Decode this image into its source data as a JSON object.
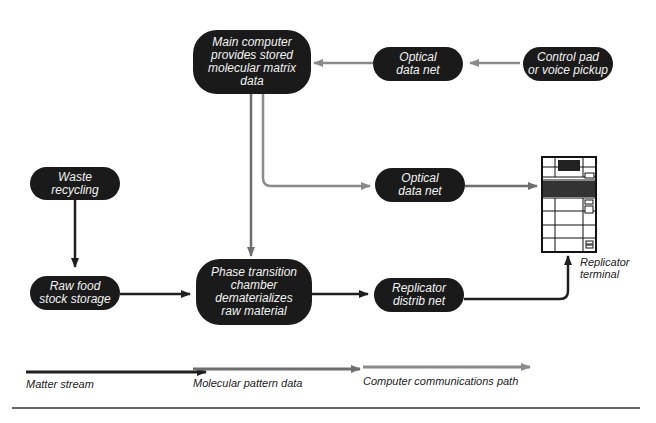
{
  "nodes": {
    "main_computer": {
      "lines": [
        "Main computer",
        "provides stored",
        "molecular matrix",
        "data"
      ]
    },
    "optical_top": {
      "lines": [
        "Optical",
        "data net"
      ]
    },
    "control_pad": {
      "lines": [
        "Control pad",
        "or voice pickup"
      ]
    },
    "waste": {
      "lines": [
        "Waste",
        "recycling"
      ]
    },
    "optical_mid": {
      "lines": [
        "Optical",
        "data net"
      ]
    },
    "raw_food": {
      "lines": [
        "Raw food",
        "stock storage"
      ]
    },
    "phase": {
      "lines": [
        "Phase transition",
        "chamber",
        "dematerializes",
        "raw material"
      ]
    },
    "distrib": {
      "lines": [
        "Replicator",
        "distrib net"
      ]
    }
  },
  "terminal": {
    "lines": [
      "Replicator",
      "terminal"
    ]
  },
  "legend": {
    "matter": "Matter stream",
    "molecular": "Molecular pattern data",
    "computer": "Computer communications path"
  },
  "colors": {
    "matter": "#1f1f1f",
    "molecular": "#6e6e6e",
    "computer": "#8a8a8a",
    "node_fill": "#1a1a1a",
    "node_text": "#f2f2f2"
  }
}
